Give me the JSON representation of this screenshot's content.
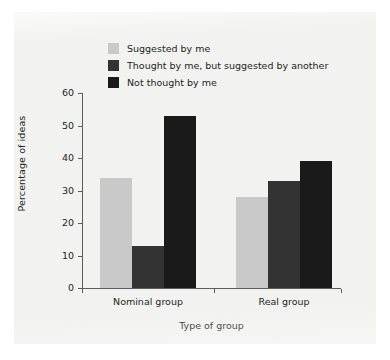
{
  "chart_data": {
    "type": "bar",
    "title": "",
    "xlabel": "Type of group",
    "ylabel": "Percentage of ideas",
    "categories": [
      "Nominal group",
      "Real group"
    ],
    "series": [
      {
        "name": "Suggested by me",
        "color": "#c9c9c9",
        "values": [
          34,
          28
        ]
      },
      {
        "name": "Thought by me, but suggested by another",
        "color": "#333333",
        "values": [
          13,
          33
        ]
      },
      {
        "name": "Not thought by me",
        "color": "#1a1a1a",
        "values": [
          53,
          39
        ]
      }
    ],
    "ylim": [
      0,
      60
    ],
    "yticks": [
      0,
      10,
      20,
      30,
      40,
      50,
      60
    ],
    "ytick_labels": [
      "0",
      "10",
      "20",
      "30",
      "40",
      "50",
      "60"
    ],
    "grid": false,
    "legend_position": "upper-left-inside"
  },
  "axes": {
    "y_title": "Percentage of ideas",
    "x_title": "Type of group"
  },
  "colors": {
    "page_background": "#ffffff",
    "panel_background": "#f2f2f0",
    "axis": "#5b5b5b",
    "text": "#231f20"
  }
}
